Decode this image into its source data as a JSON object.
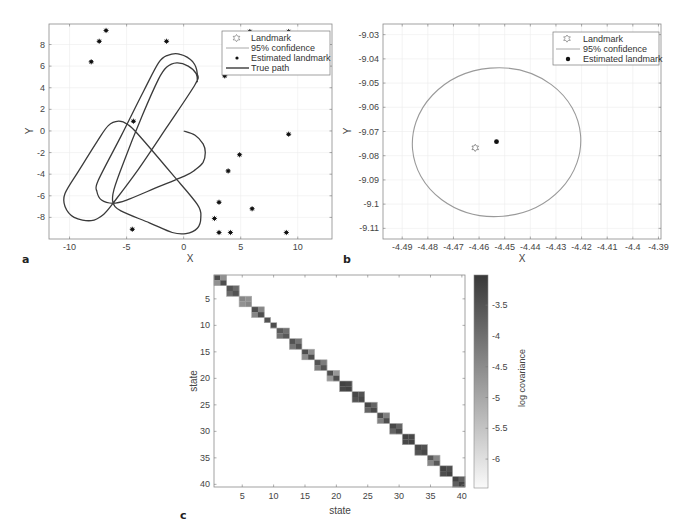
{
  "chart_data": [
    {
      "panel": "a",
      "type": "line",
      "title": "",
      "xlabel": "X",
      "ylabel": "Y",
      "xlim": [
        -11.8,
        13
      ],
      "ylim": [
        -10,
        9.9
      ],
      "xticks": [
        -10,
        -5,
        0,
        5,
        10
      ],
      "yticks": [
        -8,
        -6,
        -4,
        -2,
        0,
        2,
        4,
        6,
        8
      ],
      "grid": true,
      "legend_position": "top-right",
      "legend": [
        {
          "label": "Landmark",
          "marker": "hexagram-open"
        },
        {
          "label": "95% confidence",
          "marker": "line-light"
        },
        {
          "label": "Estimated landmark",
          "marker": "dot"
        },
        {
          "label": "True path",
          "marker": "line-dark"
        }
      ],
      "series": [
        {
          "name": "True path",
          "kind": "line",
          "points": [
            [
              0,
              0
            ],
            [
              1.0,
              -0.4
            ],
            [
              1.7,
              -1.2
            ],
            [
              1.9,
              -2.0
            ],
            [
              1.7,
              -2.9
            ],
            [
              1.0,
              -3.6
            ],
            [
              0.2,
              -4.1
            ],
            [
              -2.5,
              -5.3
            ],
            [
              -5.0,
              -6.4
            ],
            [
              -6.2,
              -6.7
            ],
            [
              -7.2,
              -6.4
            ],
            [
              -7.6,
              -5.6
            ],
            [
              -7.5,
              -4.6
            ],
            [
              -5.5,
              -0.5
            ],
            [
              -3.5,
              3.7
            ],
            [
              -2.2,
              6.3
            ],
            [
              -1.4,
              7.0
            ],
            [
              -0.3,
              7.1
            ],
            [
              0.8,
              6.4
            ],
            [
              1.2,
              5.3
            ],
            [
              1.0,
              4.3
            ],
            [
              -1.5,
              0.3
            ],
            [
              -4.0,
              -3.6
            ],
            [
              -5.9,
              -6.3
            ],
            [
              -7.0,
              -7.7
            ],
            [
              -8.1,
              -8.3
            ],
            [
              -9.6,
              -8.0
            ],
            [
              -10.4,
              -7.0
            ],
            [
              -10.4,
              -5.8
            ],
            [
              -9.2,
              -3.7
            ],
            [
              -7.6,
              -1.0
            ],
            [
              -6.6,
              0.5
            ],
            [
              -5.7,
              0.9
            ],
            [
              -4.9,
              0.6
            ],
            [
              -4.0,
              -0.3
            ],
            [
              -1.0,
              -4.0
            ],
            [
              1.2,
              -6.8
            ],
            [
              1.5,
              -8.0
            ],
            [
              1.2,
              -9.0
            ],
            [
              0.2,
              -9.5
            ],
            [
              -1.0,
              -9.4
            ],
            [
              -3.0,
              -8.5
            ],
            [
              -5.5,
              -7.4
            ],
            [
              -6.2,
              -6.6
            ],
            [
              -6.1,
              -5.4
            ],
            [
              -5.3,
              -3.0
            ],
            [
              -3.6,
              1.5
            ],
            [
              -2.2,
              4.8
            ],
            [
              -1.5,
              5.9
            ],
            [
              -0.6,
              6.3
            ],
            [
              0.4,
              6.0
            ],
            [
              1.1,
              5.3
            ],
            [
              1.2,
              4.5
            ]
          ]
        },
        {
          "name": "Estimated landmark",
          "kind": "scatter",
          "points": [
            [
              -6.8,
              9.3
            ],
            [
              -7.4,
              8.3
            ],
            [
              -8.1,
              6.4
            ],
            [
              -1.5,
              8.3
            ],
            [
              5.8,
              9.2
            ],
            [
              9.2,
              9.2
            ],
            [
              3.6,
              5.1
            ],
            [
              -4.4,
              0.9
            ],
            [
              9.2,
              -0.3
            ],
            [
              4.9,
              -2.2
            ],
            [
              3.9,
              -3.7
            ],
            [
              3.1,
              -6.6
            ],
            [
              6.0,
              -7.2
            ],
            [
              2.7,
              -8.1
            ],
            [
              3.1,
              -9.4
            ],
            [
              4.1,
              -9.4
            ],
            [
              9.0,
              -9.4
            ],
            [
              -4.5,
              -9.1
            ]
          ]
        }
      ]
    },
    {
      "panel": "b",
      "type": "scatter",
      "title": "",
      "xlabel": "X",
      "ylabel": "Y",
      "xlim": [
        -4.4975,
        -4.389
      ],
      "ylim": [
        -9.1144,
        -9.0256
      ],
      "xticks": [
        -4.49,
        -4.48,
        -4.47,
        -4.46,
        -4.45,
        -4.44,
        -4.43,
        -4.42,
        -4.41,
        -4.4,
        -4.39
      ],
      "xtick_labels": [
        "-4.49",
        "-4.48",
        "-4.47",
        "-4.46",
        "-4.45",
        "-4.44",
        "-4.43",
        "-4.42",
        "-4.41",
        "-4.4",
        "-4.39"
      ],
      "yticks": [
        -9.03,
        -9.04,
        -9.05,
        -9.06,
        -9.07,
        -9.08,
        -9.09,
        -9.1,
        -9.11
      ],
      "ytick_labels": [
        "-9.03",
        "-9.04",
        "-9.05",
        "-9.06",
        "-9.07",
        "-9.08",
        "-9.09",
        "-9.1",
        "-9.11"
      ],
      "grid": true,
      "legend_position": "top-right",
      "legend": [
        {
          "label": "Landmark",
          "marker": "hexagram-open"
        },
        {
          "label": "95% confidence",
          "marker": "line-light"
        },
        {
          "label": "Estimated landmark",
          "marker": "dot"
        }
      ],
      "series": [
        {
          "name": "Landmark",
          "kind": "scatter",
          "points": [
            [
              -4.4615,
              -9.0765
            ]
          ]
        },
        {
          "name": "Estimated landmark",
          "kind": "scatter",
          "points": [
            [
              -4.4532,
              -9.0742
            ]
          ]
        },
        {
          "name": "95% confidence",
          "kind": "ellipse",
          "center": [
            -4.4532,
            -9.0742
          ],
          "radii": [
            0.0329,
            0.0307
          ],
          "tilt_deg": -5
        }
      ]
    },
    {
      "panel": "c",
      "type": "heatmap",
      "title": "",
      "xlabel": "state",
      "ylabel": "state",
      "colorbar_label": "log covariance",
      "n_states": 40,
      "xticks": [
        5,
        10,
        15,
        20,
        25,
        30,
        35,
        40
      ],
      "yticks": [
        5,
        10,
        15,
        20,
        25,
        30,
        35,
        40
      ],
      "color_range": [
        -6.47,
        -3.01
      ],
      "colorbar_ticks": [
        -3.5,
        -4,
        -4.5,
        -5,
        -5.5,
        -6
      ],
      "colorbar_tick_labels": [
        "-3.5",
        "-4",
        "-4.5",
        "-5",
        "-5.5",
        "-6"
      ],
      "blocks": [
        {
          "start": 1,
          "size": 2,
          "diag": -3.4,
          "off": -4.6
        },
        {
          "start": 3,
          "size": 2,
          "diag": -3.5,
          "off": -3.9
        },
        {
          "start": 5,
          "size": 2,
          "diag": -4.4,
          "off": -4.6
        },
        {
          "start": 7,
          "size": 2,
          "diag": -3.4,
          "off": -4.4
        },
        {
          "start": 9,
          "size": 1,
          "diag": -3.5,
          "off": -3.5
        },
        {
          "start": 10,
          "size": 1,
          "diag": -3.4,
          "off": -3.4
        },
        {
          "start": 11,
          "size": 2,
          "diag": -3.6,
          "off": -4.0
        },
        {
          "start": 13,
          "size": 2,
          "diag": -3.5,
          "off": -4.1
        },
        {
          "start": 15,
          "size": 2,
          "diag": -3.4,
          "off": -4.5
        },
        {
          "start": 17,
          "size": 2,
          "diag": -3.5,
          "off": -4.2
        },
        {
          "start": 19,
          "size": 2,
          "diag": -3.4,
          "off": -4.7
        },
        {
          "start": 21,
          "size": 2,
          "diag": -3.2,
          "off": -3.3
        },
        {
          "start": 23,
          "size": 2,
          "diag": -3.3,
          "off": -3.5
        },
        {
          "start": 25,
          "size": 2,
          "diag": -3.3,
          "off": -3.8
        },
        {
          "start": 27,
          "size": 2,
          "diag": -3.4,
          "off": -4.3
        },
        {
          "start": 29,
          "size": 2,
          "diag": -3.3,
          "off": -3.8
        },
        {
          "start": 31,
          "size": 2,
          "diag": -3.2,
          "off": -3.3
        },
        {
          "start": 33,
          "size": 2,
          "diag": -3.3,
          "off": -3.5
        },
        {
          "start": 35,
          "size": 2,
          "diag": -3.6,
          "off": -4.4
        },
        {
          "start": 37,
          "size": 2,
          "diag": -3.2,
          "off": -3.4
        },
        {
          "start": 39,
          "size": 2,
          "diag": -3.2,
          "off": -3.7
        }
      ]
    }
  ],
  "panels": {
    "a": {
      "label": "a",
      "xlabel": "X",
      "ylabel": "Y",
      "legend": [
        "Landmark",
        "95% confidence",
        "Estimated landmark",
        "True path"
      ]
    },
    "b": {
      "label": "b",
      "xlabel": "X",
      "ylabel": "Y",
      "legend": [
        "Landmark",
        "95% confidence",
        "Estimated landmark"
      ]
    },
    "c": {
      "label": "c",
      "xlabel": "state",
      "ylabel": "state",
      "colorbar_label": "log covariance"
    }
  },
  "colors": {
    "axis": "#7f7f7f",
    "grid": "#ececec",
    "path": "#3a3a3a",
    "marker": "#111111",
    "confidence": "#9a9a9a",
    "block_border": "#b0b0b0"
  }
}
